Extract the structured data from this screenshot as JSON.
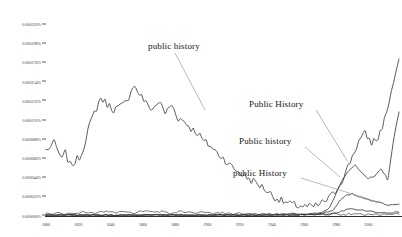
{
  "chart_data": {
    "type": "line",
    "title": "",
    "subtitle": "",
    "xlabel": "",
    "ylabel": "",
    "xlim": [
      1800,
      2019
    ],
    "ylim": [
      0,
      0.000231
    ],
    "grid": false,
    "legend_position": "inline-annotations",
    "x_ticks": [
      "1800",
      "1820",
      "1840",
      "1860",
      "1880",
      "1900",
      "1920",
      "1940",
      "1960",
      "1980",
      "2000"
    ],
    "y_ticks": [
      "0.000220%",
      "0.000198%",
      "0.000176%",
      "0.000154%",
      "0.000132%",
      "0.000110%",
      "0.000088%",
      "0.000066%",
      "0.000044%",
      "0.000022%",
      "0.000000%"
    ],
    "y_tick_values": [
      0.00022,
      0.000198,
      0.000176,
      0.000154,
      0.000132,
      0.00011,
      8.8e-05,
      6.6e-05,
      4.4e-05,
      2.2e-05,
      0.0
    ],
    "annotations": [
      {
        "label": "public history",
        "series": "public history"
      },
      {
        "label": "Public History",
        "series": "Public History"
      },
      {
        "label": "Public history",
        "series": "Public history"
      },
      {
        "label": "public History",
        "series": "public History"
      }
    ],
    "series": [
      {
        "name": "public history",
        "x": [
          1800,
          1805,
          1810,
          1812,
          1815,
          1818,
          1822,
          1826,
          1830,
          1834,
          1838,
          1842,
          1846,
          1850,
          1854,
          1858,
          1862,
          1866,
          1870,
          1874,
          1878,
          1882,
          1886,
          1890,
          1894,
          1898,
          1902,
          1906,
          1910,
          1914,
          1918,
          1922,
          1926,
          1930,
          1934,
          1938,
          1942,
          1946,
          1950,
          1954,
          1958,
          1962,
          1966,
          1970,
          1974,
          1978,
          1982,
          1986,
          1990,
          1994,
          1998,
          2002,
          2006,
          2010,
          2014,
          2019
        ],
        "values": [
          7.5e-05,
          8.3e-05,
          6.4e-05,
          7.2e-05,
          5.8e-05,
          6.2e-05,
          7e-05,
          9.8e-05,
          0.000118,
          0.000135,
          0.000128,
          0.000122,
          0.000125,
          0.00013,
          0.00015,
          0.00014,
          0.000129,
          0.000122,
          0.000131,
          0.000118,
          0.000127,
          0.000112,
          0.000108,
          0.0001,
          9.5e-05,
          8.5e-05,
          8e-05,
          7.2e-05,
          6.6e-05,
          5.8e-05,
          5.2e-05,
          4.7e-05,
          4.2e-05,
          3.8e-05,
          3.3e-05,
          2.7e-05,
          2.1e-05,
          1.7e-05,
          1.4e-05,
          1.2e-05,
          1.1e-05,
          1e-05,
          1e-05,
          1.3e-05,
          1.8e-05,
          2.4e-05,
          3.5e-05,
          5e-05,
          6.8e-05,
          8.5e-05,
          9.4e-05,
          8.4e-05,
          8.9e-05,
          0.00011,
          0.00014,
          0.00018
        ]
      },
      {
        "name": "Public History",
        "x": [
          1800,
          1850,
          1900,
          1940,
          1960,
          1970,
          1976,
          1980,
          1984,
          1988,
          1992,
          1996,
          2000,
          2004,
          2008,
          2012,
          2016,
          2019
        ],
        "values": [
          5e-07,
          6e-07,
          8e-07,
          1e-06,
          1.3e-06,
          3e-06,
          9e-06,
          2.6e-05,
          4.2e-05,
          5.1e-05,
          5.8e-05,
          4.9e-05,
          4.2e-05,
          4.6e-05,
          5.3e-05,
          4.2e-05,
          9e-05,
          0.000119
        ]
      },
      {
        "name": "Public history",
        "x": [
          1800,
          1850,
          1900,
          1940,
          1960,
          1970,
          1978,
          1982,
          1986,
          1990,
          1994,
          1998,
          2002,
          2006,
          2010,
          2014,
          2019
        ],
        "values": [
          4e-07,
          5e-07,
          6e-07,
          8e-07,
          1e-06,
          1.8e-06,
          6e-06,
          1.6e-05,
          2.3e-05,
          2.5e-05,
          2.2e-05,
          1.9e-05,
          1.7e-05,
          1.5e-05,
          1.3e-05,
          1.2e-05,
          1.3e-05
        ]
      },
      {
        "name": "public History",
        "x": [
          1800,
          1850,
          1900,
          1940,
          1965,
          1975,
          1982,
          1986,
          1990,
          1995,
          2000,
          2005,
          2010,
          2015,
          2019
        ],
        "values": [
          3e-07,
          4e-07,
          5e-07,
          6e-07,
          8e-07,
          1.2e-06,
          3.5e-06,
          7e-06,
          8e-06,
          6.5e-06,
          4.8e-06,
          4e-06,
          3.6e-06,
          3.4e-06,
          3.6e-06
        ]
      },
      {
        "name": "baseline-noise",
        "x": [
          1800,
          1806,
          1812,
          1818,
          1824,
          1830,
          1836,
          1842,
          1848,
          1854,
          1860,
          1866,
          1872,
          1878,
          1884,
          1890,
          1896,
          1902,
          1908,
          1914,
          1920,
          1930,
          1940,
          1960,
          1980,
          2000,
          2019
        ],
        "values": [
          2e-06,
          2.8e-06,
          1.8e-06,
          3.2e-06,
          4e-06,
          2.6e-06,
          4.8e-06,
          3e-06,
          4.4e-06,
          2.4e-06,
          5.2e-06,
          3.4e-06,
          4.6e-06,
          2.2e-06,
          5e-06,
          3e-06,
          4.2e-06,
          2.6e-06,
          3.4e-06,
          2e-06,
          2.4e-06,
          1.8e-06,
          1.6e-06,
          1.4e-06,
          1.2e-06,
          1.4e-06,
          1.6e-06
        ]
      }
    ],
    "colors": {
      "line": "#3a3a3a",
      "axis": "#2e2e2e",
      "tick_label": "#3c3c3c",
      "annotation": "#15130f",
      "leader": "#8a8a8a",
      "background": "#ffffff"
    }
  }
}
